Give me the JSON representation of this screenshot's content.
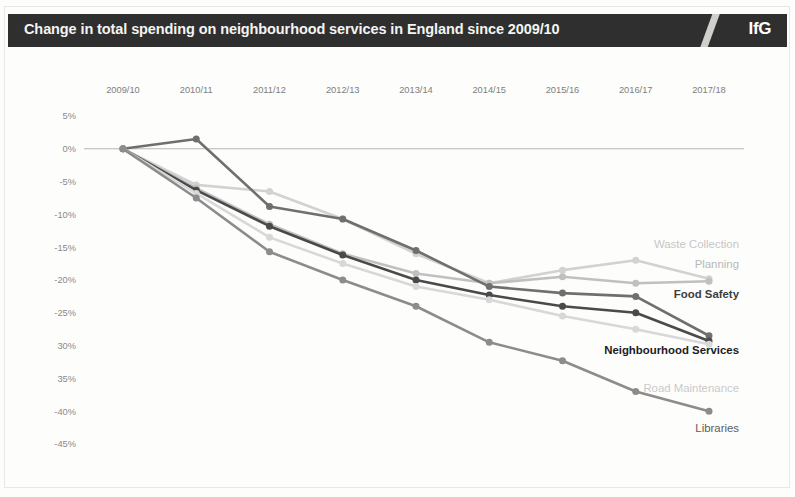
{
  "header": {
    "title": "Change in total spending on neighbourhood services in England since 2009/10",
    "logo": "IfG"
  },
  "chart_data": {
    "type": "line",
    "title": "Change in total spending on neighbourhood services in England since 2009/10",
    "xlabel": "",
    "ylabel": "",
    "ylim": [
      -45,
      5
    ],
    "ytick_labels": [
      "5%",
      "0%",
      "-5%",
      "-10%",
      "-15%",
      "-20%",
      "-25%",
      "30%",
      "35%",
      "-40%",
      "-45%"
    ],
    "ytick_values": [
      5,
      0,
      -5,
      -10,
      -15,
      -20,
      -25,
      -30,
      -35,
      -40,
      -45
    ],
    "grid": false,
    "zero_line": true,
    "legend_position": "right-inline",
    "categories": [
      "2009/10",
      "2010/11",
      "2011/12",
      "2012/13",
      "2013/14",
      "2014/15",
      "2015/16",
      "2016/17",
      "2017/18"
    ],
    "series": [
      {
        "name": "Waste Collection",
        "color": "#d2d2d2",
        "label_color": "#c6c6c6",
        "label_bold": false,
        "label_y": -14.5,
        "values": [
          0,
          -5.5,
          -6.5,
          -10.7,
          -16.0,
          -20.5,
          -18.5,
          -17.0,
          -19.8
        ]
      },
      {
        "name": "Planning",
        "color": "#c0c0c0",
        "label_color": "#b8b8b8",
        "label_bold": false,
        "label_y": -17.6,
        "values": [
          0,
          -6.0,
          -11.5,
          -16.0,
          -19.0,
          -20.5,
          -19.5,
          -20.5,
          -20.2
        ]
      },
      {
        "name": "Food Safety",
        "color": "#6f6f6f",
        "label_color": "#3d3d3d",
        "label_bold": true,
        "label_y": -22.2,
        "values": [
          0,
          1.5,
          -8.8,
          -10.7,
          -15.5,
          -21.0,
          -22.0,
          -22.5,
          -28.5
        ]
      },
      {
        "name": "Neighbourhood Services",
        "color": "#4a4a4a",
        "label_color": "#1c1c1c",
        "label_bold": true,
        "label_y": -30.6,
        "values": [
          0,
          -6.3,
          -11.8,
          -16.2,
          -20.0,
          -22.3,
          -24.0,
          -25.0,
          -29.3
        ]
      },
      {
        "name": "Road Maintenance",
        "color": "#d8d8d8",
        "label_color": "#cacaca",
        "label_bold": false,
        "label_y": -36.4,
        "values": [
          0,
          -6.8,
          -13.5,
          -17.5,
          -21.0,
          -23.0,
          -25.5,
          -27.5,
          -29.8
        ]
      },
      {
        "name": "Libraries",
        "color": "#8c8c8c",
        "label_color": "#5c5c5c",
        "label_bold": false,
        "label_y": -42.6,
        "values": [
          0,
          -7.5,
          -15.7,
          -20.0,
          -24.0,
          -29.5,
          -32.3,
          -37.0,
          -40.0
        ]
      }
    ]
  }
}
